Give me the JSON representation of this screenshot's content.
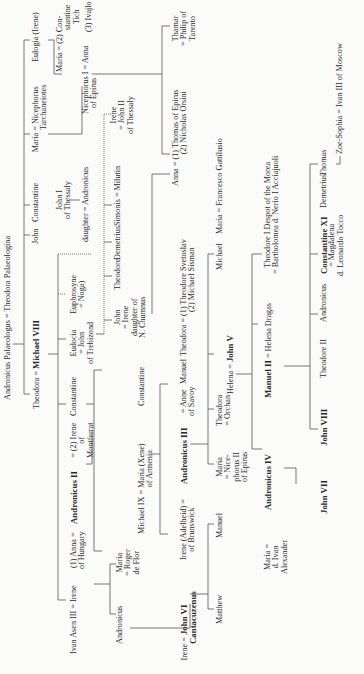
{
  "colors": {
    "ink": "#2a2a2a",
    "paper": "#fbfbf9",
    "line": "#555555"
  },
  "nodes": {
    "root": "Andronicus Palaeologus = Theodora Palaeologina",
    "theodora_m8": "Theodora = ",
    "michael8": "Michael VIII",
    "john_g2": "John",
    "constantine_g2": "Constantine",
    "maria_tarch": "Maria = Nicephorus",
    "tarch2": "Tarchaneiotes",
    "eulogia": "Eulogia (Irene)",
    "ivan_asen": "Ivan Asen III = Irene",
    "anna_hungary": "(1) Anna = ",
    "anna_hungary2": "of Hungary",
    "andronicus2": "Andronicus II",
    "irene_monf": "= (2) Irene",
    "irene_monf2": "of",
    "irene_monf3": "Montferrat",
    "constantine_g3": "Constantine",
    "eudocia": "Eudocia",
    "eudocia2": "= John",
    "eudocia3": "of Trebizond",
    "euphrosyne": "Euphrosyne",
    "euphrosyne2": "= Noga)",
    "john1_thessaly": "John I",
    "john1_thessaly2": "of Thessaly",
    "daughter_andr": "daughter = Andronicus",
    "maria_g3": "Maria = (2) Con-",
    "maria_g3b": "stantine",
    "maria_g3c": "Tich",
    "ivajlo": "(3) Ivajlo",
    "niceph1": "Nicephorus I = Anna",
    "niceph1b": "of Epirus",
    "andronicus_g4": "Andronicus",
    "maria_roger": "Maria",
    "maria_roger2": "= Roger",
    "maria_roger3": "de Flor",
    "michael9": "Michael IX = Maria (Xene)",
    "michael9b": "of Armenia",
    "constantine_g4": "Constantine",
    "john_irene": "John",
    "john_irene2": "= Irene",
    "john_irene3": "daughter of",
    "john_irene4": "N. Chumnus",
    "theodore_g4": "Theodore",
    "demetrius_g4": "Demetrius",
    "simonis": "Simonis = Milutin",
    "irene_j2": "Irene",
    "irene_j2b": "= John II",
    "irene_j2c": "of Thessaly",
    "anna_thomas": "Anna = (1) Thomas of Epirus",
    "anna_thomas2": "(2) Nicholas Orsini",
    "thamar": "Thamar",
    "thamar2": "= Philip of",
    "thamar3": "Tarento",
    "irene_j6": "Irene = ",
    "john6": "John VI",
    "john6b": "Cantacuzenus",
    "irene_adel": "Irene (Adelheid) = ",
    "irene_adel2": "of Brunswick",
    "andronicus3": "Andronicus III",
    "anne_savoy": "= Anne",
    "anne_savoy2": "of Savoy",
    "manuel_g5": "Manuel",
    "theodora_svet": "Theodora = (1) Theodore Svetoslav",
    "theodora_svet2": "(2) Michael Sisman",
    "matthew": "Matthew",
    "manuel_g6": "Manuel",
    "maria_niceph": "Maria",
    "maria_niceph2": "= Nice-",
    "maria_niceph3": "phorus II",
    "maria_niceph4": "of Epirus",
    "theodora_orchan": "Theodora",
    "theodora_orchan2": "= Orchan",
    "helena": "Helena = ",
    "john5": "John V",
    "michael_g6": "Michael",
    "maria_gatt": "Maria = Francesco Gattilusio",
    "maria_alex": "Maria = ",
    "maria_alex2": "d. Ivan",
    "maria_alex3": "Alexander",
    "andronicus4": "Andronicus IV",
    "manuel2": "Manuel II",
    "helena_dragas": " = Helena Dragas",
    "theodore1": "Theodore I Despot of the Morea",
    "theodore1b": "= Bartholomea d. Nerio I Acciajuoli",
    "john7": "John VII",
    "john8": "John VIII",
    "theodore2": "Theodore II",
    "andronicus_g8": "Andronicus",
    "constantine11": "Constantine XI",
    "constantine11b": "= Magdalena",
    "constantine11c": "d. Leonardo Tocco",
    "demetrius_g8": "Demetrius",
    "thomas": "Thomas",
    "zoe": "Zoe-Sophia = Ivan III of Moscow"
  }
}
